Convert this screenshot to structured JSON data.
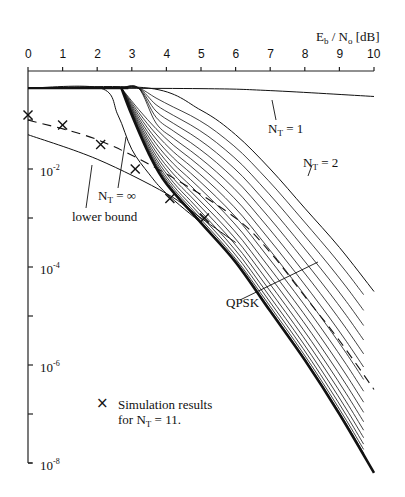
{
  "chart_data": {
    "type": "line",
    "title": "",
    "xlabel": "Eb / No [dB]",
    "ylabel": "",
    "x_ticks": [
      "0",
      "1",
      "2",
      "3",
      "4",
      "5",
      "6",
      "7",
      "8",
      "9",
      "10"
    ],
    "y_ticks": [
      "10^-2",
      "10^-4",
      "10^-6",
      "10^-8"
    ],
    "y_tick_minor": [
      "10^-3",
      "10^-5",
      "10^-7"
    ],
    "xlim": [
      0,
      10
    ],
    "ylim_log10": [
      -8,
      0
    ],
    "x_axis_position": "top",
    "grid": false,
    "series": [
      {
        "name": "N_T = 1",
        "style": "solid",
        "points": [
          [
            0,
            -0.35
          ],
          [
            5,
            -0.36
          ],
          [
            7,
            -0.4
          ],
          [
            10,
            -0.52
          ]
        ]
      },
      {
        "name": "N_T = 2",
        "style": "solid",
        "points": [
          [
            0,
            -0.35
          ],
          [
            3.5,
            -0.35
          ],
          [
            5,
            -0.8
          ],
          [
            6,
            -1.3
          ],
          [
            7,
            -2
          ],
          [
            8,
            -2.8
          ],
          [
            9,
            -3.6
          ],
          [
            10,
            -4.5
          ]
        ]
      },
      {
        "name": "N_T = 3..20 (family)",
        "style": "solid",
        "note": "dense family of curves between N_T=2 and QPSK"
      },
      {
        "name": "N_T = ∞",
        "style": "solid",
        "points": [
          [
            0,
            -0.35
          ],
          [
            2.1,
            -0.35
          ],
          [
            2.6,
            -0.9
          ],
          [
            3,
            -1.6
          ],
          [
            3.5,
            -2.1
          ],
          [
            4,
            -2.5
          ],
          [
            5,
            -3.1
          ]
        ]
      },
      {
        "name": "QPSK",
        "style": "solid-bold",
        "points": [
          [
            2.7,
            -0.35
          ],
          [
            3,
            -0.9
          ],
          [
            3.5,
            -1.7
          ],
          [
            4,
            -2.3
          ],
          [
            5,
            -3.1
          ],
          [
            6,
            -3.9
          ],
          [
            7,
            -4.9
          ],
          [
            8,
            -5.9
          ],
          [
            9,
            -7.0
          ],
          [
            10,
            -8.2
          ]
        ]
      },
      {
        "name": "lower bound",
        "style": "solid",
        "points": [
          [
            0,
            -1.3
          ],
          [
            2,
            -1.8
          ],
          [
            4,
            -2.5
          ],
          [
            5,
            -3.0
          ],
          [
            6,
            -3.5
          ]
        ]
      },
      {
        "name": "N_T = 11 (dashed)",
        "style": "dashed",
        "points": [
          [
            0,
            -1.0
          ],
          [
            2,
            -1.4
          ],
          [
            4,
            -2.1
          ],
          [
            6,
            -3.0
          ],
          [
            7,
            -3.7
          ],
          [
            8,
            -4.6
          ],
          [
            9,
            -5.5
          ],
          [
            10,
            -6.5
          ]
        ]
      },
      {
        "name": "Simulation results for N_T = 11",
        "style": "markers-x",
        "points": [
          [
            0,
            -0.9
          ],
          [
            1,
            -1.1
          ],
          [
            2.1,
            -1.5
          ],
          [
            3.1,
            -2.0
          ],
          [
            4.1,
            -2.6
          ],
          [
            5.1,
            -3.0
          ]
        ]
      }
    ],
    "annotations": [
      "N_T = 1",
      "N_T = 2",
      "N_T = ∞",
      "lower bound",
      "QPSK",
      "× Simulation results for N_T = 11."
    ]
  },
  "labels": {
    "xlabel_main": "E",
    "xlabel_sub1": "b",
    "xlabel_mid": " / N",
    "xlabel_sub2": "o",
    "xlabel_unit": " [dB]",
    "nt1_pre": "N",
    "nt1_sub": "T",
    "nt1_post": " = 1",
    "nt2_pre": "N",
    "nt2_sub": "T",
    "nt2_post": " = 2",
    "ntinf_pre": "N",
    "ntinf_sub": "T",
    "ntinf_post": " = ∞",
    "lower_bound": "lower bound",
    "qpsk": "QPSK",
    "legend_marker": "×",
    "legend_line1": "Simulation  results",
    "legend_line2_pre": "for N",
    "legend_line2_sub": "T",
    "legend_line2_post": " = 11.",
    "ytick_base": "10",
    "ytick_exp": [
      "-2",
      "-4",
      "-6",
      "-8"
    ]
  }
}
